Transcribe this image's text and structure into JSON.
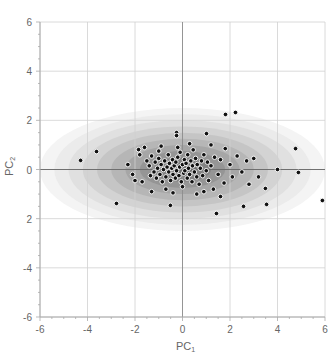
{
  "chart_data": {
    "type": "scatter",
    "title": "",
    "xlabel": "PC",
    "xlabel_sub": "1",
    "ylabel": "PC",
    "ylabel_sub": "2",
    "xlim": [
      -6,
      6
    ],
    "ylim": [
      -6,
      6
    ],
    "x_ticks": [
      -6,
      -4,
      -2,
      0,
      2,
      4,
      6
    ],
    "y_ticks": [
      6,
      4,
      2,
      0,
      2,
      -4,
      -6
    ],
    "y_tick_labels": [
      "6",
      "4",
      "2",
      "0",
      "2",
      "-4",
      "-6"
    ],
    "x_tick_labels": [
      "-6",
      "-4",
      "-2",
      "0",
      "2",
      "4",
      "6"
    ],
    "grid": true,
    "legend": null,
    "background": {
      "type": "filled-contour-ellipses",
      "center": [
        0,
        0
      ],
      "levels": 10,
      "max_semi_axes": [
        6.0,
        2.5
      ],
      "colors": [
        "#f4f4f4",
        "#ebebeb",
        "#e0e0e0",
        "#d3d3d3",
        "#c5c5c5",
        "#b6b6b6",
        "#a6a6a6",
        "#959595",
        "#838383",
        "#707070"
      ]
    },
    "points": [
      [
        -4.29,
        0.37
      ],
      [
        -3.62,
        0.73
      ],
      [
        -2.78,
        -1.38
      ],
      [
        -1.85,
        0.81
      ],
      [
        1.81,
        2.24
      ],
      [
        2.23,
        2.32
      ],
      [
        4.76,
        0.85
      ],
      [
        4.88,
        -0.12
      ],
      [
        4.0,
        0.0
      ],
      [
        5.89,
        -1.26
      ],
      [
        3.54,
        -1.42
      ],
      [
        2.57,
        -1.5
      ],
      [
        1.43,
        -1.79
      ],
      [
        3.49,
        -0.77
      ],
      [
        -0.25,
        1.5
      ],
      [
        -0.25,
        1.38
      ],
      [
        1.01,
        1.46
      ],
      [
        -0.51,
        -1.46
      ],
      [
        -2.0,
        -0.45
      ],
      [
        -1.7,
        -0.5
      ],
      [
        -1.5,
        0.35
      ],
      [
        -1.4,
        0.15
      ],
      [
        -1.35,
        -0.25
      ],
      [
        -1.3,
        0.55
      ],
      [
        -1.2,
        -0.1
      ],
      [
        -1.15,
        0.3
      ],
      [
        -1.1,
        -0.35
      ],
      [
        -1.05,
        0.05
      ],
      [
        -1.0,
        0.45
      ],
      [
        -0.95,
        -0.2
      ],
      [
        -0.9,
        0.2
      ],
      [
        -0.85,
        -0.5
      ],
      [
        -0.8,
        0.0
      ],
      [
        -0.75,
        0.35
      ],
      [
        -0.7,
        -0.3
      ],
      [
        -0.65,
        0.1
      ],
      [
        -0.6,
        0.6
      ],
      [
        -0.58,
        -0.1
      ],
      [
        -0.55,
        0.25
      ],
      [
        -0.5,
        -0.45
      ],
      [
        -0.45,
        0.05
      ],
      [
        -0.42,
        0.4
      ],
      [
        -0.4,
        -0.2
      ],
      [
        -0.35,
        0.15
      ],
      [
        -0.3,
        -0.35
      ],
      [
        -0.28,
        0.3
      ],
      [
        -0.25,
        -0.05
      ],
      [
        -0.2,
        0.5
      ],
      [
        -0.15,
        -0.25
      ],
      [
        -0.12,
        0.1
      ],
      [
        -0.1,
        0.7
      ],
      [
        -0.05,
        -0.5
      ],
      [
        0.0,
        0.2
      ],
      [
        0.05,
        -0.15
      ],
      [
        0.08,
        0.4
      ],
      [
        0.1,
        -0.05
      ],
      [
        0.15,
        0.25
      ],
      [
        0.2,
        -0.35
      ],
      [
        0.22,
        0.6
      ],
      [
        0.25,
        0.05
      ],
      [
        0.3,
        -0.2
      ],
      [
        0.35,
        0.35
      ],
      [
        0.4,
        -0.5
      ],
      [
        0.42,
        0.15
      ],
      [
        0.45,
        0.8
      ],
      [
        0.5,
        -0.1
      ],
      [
        0.55,
        0.45
      ],
      [
        0.6,
        -0.3
      ],
      [
        0.62,
        0.2
      ],
      [
        0.7,
        -0.6
      ],
      [
        0.75,
        0.05
      ],
      [
        0.8,
        0.35
      ],
      [
        0.85,
        -0.25
      ],
      [
        0.9,
        0.6
      ],
      [
        1.0,
        -0.05
      ],
      [
        1.05,
        0.3
      ],
      [
        1.1,
        -0.45
      ],
      [
        1.2,
        0.15
      ],
      [
        1.3,
        -0.8
      ],
      [
        1.35,
        0.5
      ],
      [
        1.5,
        -0.2
      ],
      [
        1.6,
        0.4
      ],
      [
        1.75,
        -0.55
      ],
      [
        1.8,
        0.85
      ],
      [
        2.0,
        0.2
      ],
      [
        2.1,
        -0.3
      ],
      [
        2.3,
        0.55
      ],
      [
        2.5,
        -0.1
      ],
      [
        2.7,
        0.35
      ],
      [
        3.0,
        0.45
      ],
      [
        -1.6,
        0.9
      ],
      [
        -0.9,
        0.95
      ],
      [
        0.3,
        1.05
      ],
      [
        1.2,
        1.0
      ],
      [
        -1.3,
        -0.9
      ],
      [
        -0.4,
        -0.95
      ],
      [
        0.6,
        -1.0
      ],
      [
        -2.3,
        0.2
      ],
      [
        -2.1,
        -0.2
      ],
      [
        2.8,
        -0.6
      ],
      [
        3.2,
        -0.3
      ],
      [
        -0.7,
        -0.8
      ],
      [
        0.9,
        -0.9
      ],
      [
        1.6,
        -1.1
      ],
      [
        -1.8,
        0.6
      ],
      [
        -0.2,
        0.9
      ],
      [
        0.0,
        -0.7
      ],
      [
        -1.0,
        0.75
      ]
    ]
  }
}
